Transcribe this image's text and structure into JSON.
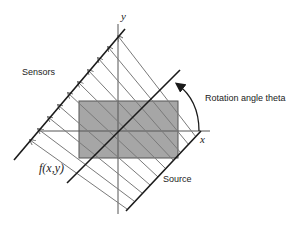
{
  "diagram": {
    "labels": {
      "sensors": "Sensors",
      "rotation": "Rotation angle theta",
      "source": "Source",
      "function": "f(x,y)",
      "x_axis": "x",
      "y_axis": "y"
    },
    "colors": {
      "object_fill": "#a6a6a6",
      "line": "#1a1a1a",
      "ray": "#7a7a7a",
      "axis": "#555555"
    },
    "elements": {
      "object": "gray rectangle f(x,y)",
      "rays": "parallel rays from source to sensors with arrowheads at sensor line",
      "rotation_arrow": "curved arrow from x-axis toward rotated axis"
    }
  }
}
